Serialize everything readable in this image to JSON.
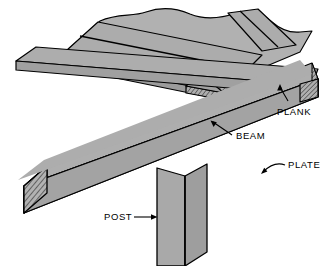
{
  "figure": {
    "type": "isometric-construction-diagram",
    "background_color": "#FFFFFF",
    "line_color": "#000000",
    "wood_face_color": "#A8A8A8",
    "wood_top_color": "#B4B4B4",
    "wood_shadow_color": "#9A9A9A",
    "endgrain_color": "#B0B0B0"
  },
  "labels": {
    "plank": "PLANK",
    "beam": "BEAM",
    "plate": "PLATE",
    "post": "POST"
  },
  "members": [
    {
      "id": "plank",
      "name": "PLANK",
      "description": "Horizontal decking boards laid across the beam, shown with broken/torn far edge",
      "count_visible": 4,
      "orientation": "upper-left to lower-right, topmost layer"
    },
    {
      "id": "beam",
      "name": "BEAM",
      "description": "Large timber running lower-left to upper-right, supporting the planks",
      "orientation": "diagonal ascending right"
    },
    {
      "id": "plate",
      "name": "PLATE",
      "description": "Timber running upper-left to lower-right, carried on the post",
      "orientation": "diagonal descending right"
    },
    {
      "id": "post",
      "name": "POST",
      "description": "Vertical column supporting the plate and beam intersection",
      "orientation": "vertical"
    }
  ],
  "leaders": [
    {
      "id": "plank-leader",
      "label": "PLANK",
      "style": "curved-arrow",
      "points_to": "plank end grain",
      "direction": "up-left"
    },
    {
      "id": "beam-leader",
      "label": "BEAM",
      "style": "straight-arrow",
      "points_to": "beam lower edge",
      "direction": "up-left"
    },
    {
      "id": "plate-leader",
      "label": "PLATE",
      "style": "curved-arrow",
      "points_to": "plate top face",
      "direction": "down-left"
    },
    {
      "id": "post-leader",
      "label": "POST",
      "style": "straight-arrow",
      "points_to": "post left face",
      "direction": "right"
    }
  ]
}
